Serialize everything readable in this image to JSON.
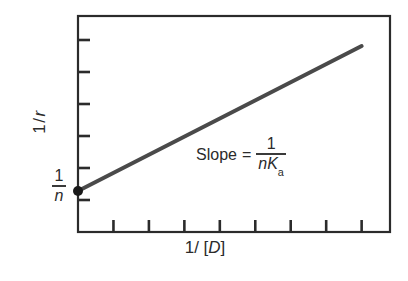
{
  "chart_data": {
    "type": "line",
    "title": "",
    "subtitle": "",
    "xlabel": "1/ [D]",
    "ylabel": "1/r",
    "xlabel_parts": {
      "one": "1",
      "slash": "/",
      "bracket_open": "[",
      "variable": "D",
      "bracket_close": "]"
    },
    "ylabel_parts": {
      "one": "1",
      "slash": "/",
      "variable": "r"
    },
    "grid": false,
    "legend": "none",
    "xlim": [
      0,
      8.8
    ],
    "ylim": [
      0,
      6.75
    ],
    "x_ticks": [
      1,
      2,
      3,
      4,
      5,
      6,
      7,
      8
    ],
    "y_ticks": [
      1,
      2,
      3,
      4,
      5,
      6
    ],
    "x_tick_labels": [],
    "y_tick_labels": [],
    "series": [
      {
        "name": "double-reciprocal plot",
        "type": "line",
        "color": "#4a4a4a",
        "width": 4,
        "points": [
          {
            "x": 0.0,
            "y": 1.28
          },
          {
            "x": 8.0,
            "y": 5.81
          }
        ]
      }
    ],
    "markers": [
      {
        "name": "y-intercept",
        "x": 0.0,
        "y": 1.28,
        "color": "#1a1a1a",
        "radius": 5,
        "label": "1/n"
      }
    ],
    "annotations": [
      {
        "name": "intercept-label",
        "text": "1/n",
        "numerator": "1",
        "denominator": "n",
        "x": 0.0,
        "y": 1.28
      },
      {
        "name": "slope-annotation",
        "text": "Slope = 1/(nKa)",
        "prefix": "Slope",
        "equals": "=",
        "numerator": "1",
        "denominator": "nK",
        "denominator_subscript": "a",
        "x": 3.4,
        "y": 3.3
      }
    ],
    "colors": {
      "line": "#4a4a4a",
      "axis": "#2b2b2b",
      "marker": "#1a1a1a",
      "text": "#2b2b2b",
      "background": "#ffffff"
    }
  },
  "figure": {
    "frame": {
      "left": 78,
      "top": 16,
      "right": 390,
      "bottom": 232
    }
  }
}
